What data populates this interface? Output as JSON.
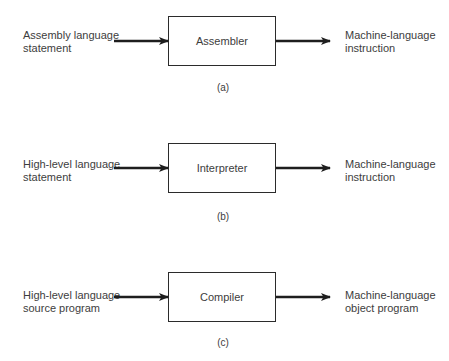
{
  "diagram": {
    "type": "translation-process-flow",
    "panels": [
      {
        "id": "a",
        "input": [
          "Assembly language",
          "statement"
        ],
        "process": "Assembler",
        "output": [
          "Machine-language",
          "instruction"
        ],
        "caption": "(a)"
      },
      {
        "id": "b",
        "input": [
          "High-level language",
          "statement"
        ],
        "process": "Interpreter",
        "output": [
          "Machine-language",
          "instruction"
        ],
        "caption": "(b)"
      },
      {
        "id": "c",
        "input": [
          "High-level language",
          "source program"
        ],
        "process": "Compiler",
        "output": [
          "Machine-language",
          "object program"
        ],
        "caption": "(c)"
      }
    ],
    "colors": {
      "stroke": "#2b2b2b",
      "text": "#3d3d3d",
      "background": "#ffffff"
    }
  }
}
